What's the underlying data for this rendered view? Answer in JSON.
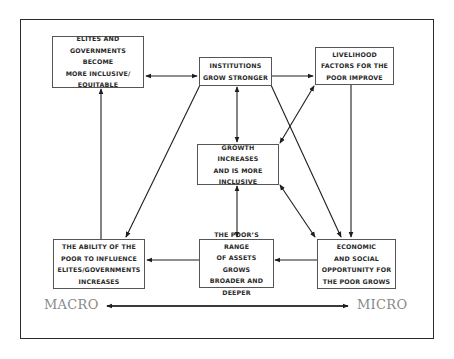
{
  "diagram": {
    "nodes": [
      {
        "id": "elites",
        "label": "ELITES AND\nGOVERNMENTS BECOME\nMORE INCLUSIVE/\nEQUITABLE"
      },
      {
        "id": "institutions",
        "label": "INSTITUTIONS\nGROW STRONGER"
      },
      {
        "id": "livelihood",
        "label": "LIVELIHOOD\nFACTORS FOR THE\nPOOR IMPROVE"
      },
      {
        "id": "growth",
        "label": "GROWTH INCREASES\nAND IS MORE\nINCLUSIVE"
      },
      {
        "id": "ability",
        "label": "THE ABILITY OF THE\nPOOR TO INFLUENCE\nELITES/GOVERNMENTS\nINCREASES"
      },
      {
        "id": "assets",
        "label": "THE POOR’S RANGE\nOF ASSETS GROWS\nBROADER AND\nDEEPER"
      },
      {
        "id": "opportunity",
        "label": "ECONOMIC\nAND SOCIAL\nOPPORTUNITY FOR\nTHE POOR GROWS"
      }
    ],
    "edges": [
      {
        "from": "elites",
        "to": "institutions",
        "direction": "both"
      },
      {
        "from": "institutions",
        "to": "livelihood",
        "direction": "forward"
      },
      {
        "from": "institutions",
        "to": "growth",
        "direction": "both"
      },
      {
        "from": "institutions",
        "to": "ability",
        "direction": "forward"
      },
      {
        "from": "institutions",
        "to": "opportunity",
        "direction": "forward"
      },
      {
        "from": "livelihood",
        "to": "growth",
        "direction": "both"
      },
      {
        "from": "livelihood",
        "to": "opportunity",
        "direction": "forward"
      },
      {
        "from": "growth",
        "to": "assets",
        "direction": "both"
      },
      {
        "from": "growth",
        "to": "opportunity",
        "direction": "both"
      },
      {
        "from": "opportunity",
        "to": "assets",
        "direction": "forward"
      },
      {
        "from": "assets",
        "to": "ability",
        "direction": "forward"
      },
      {
        "from": "ability",
        "to": "elites",
        "direction": "forward"
      }
    ],
    "scale": {
      "left_label": "MACRO",
      "right_label": "MICRO",
      "direction": "both"
    }
  },
  "colors": {
    "line": "#1e1e1e",
    "box_border": "#555555",
    "text": "#2a2a2a",
    "scale_text": "#8a8a8a"
  }
}
